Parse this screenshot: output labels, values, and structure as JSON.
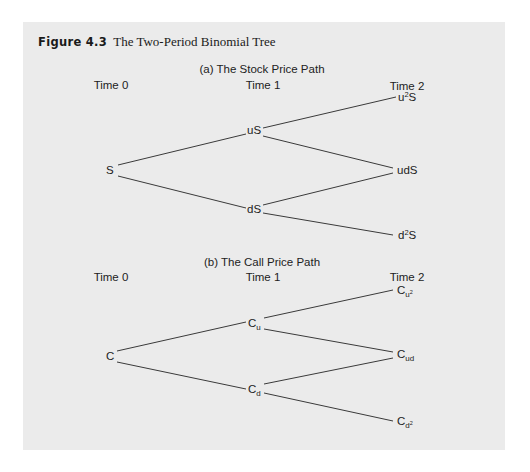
{
  "figure": {
    "number": "Figure 4.3",
    "title": "The Two-Period Binomial Tree"
  },
  "panel_a": {
    "subtitle": "(a) The Stock Price Path",
    "time_labels": [
      "Time 0",
      "Time 1",
      "Time 2"
    ],
    "nodes": {
      "root": "S",
      "up": "uS",
      "down": "dS",
      "up_up_base": "u",
      "up_up_exp": "2",
      "up_up_tail": "S",
      "up_down": "udS",
      "down_down_base": "d",
      "down_down_exp": "2",
      "down_down_tail": "S"
    }
  },
  "panel_b": {
    "subtitle": "(b) The Call Price Path",
    "time_labels": [
      "Time 0",
      "Time 1",
      "Time 2"
    ],
    "nodes": {
      "root": "C",
      "up_base": "C",
      "up_sub": "u",
      "down_base": "C",
      "down_sub": "d",
      "up_up_base": "C",
      "up_up_sub": "u",
      "up_up_exp": "2",
      "up_down_base": "C",
      "up_down_sub": "ud",
      "down_down_base": "C",
      "down_down_sub": "d",
      "down_down_exp": "2"
    }
  },
  "colors": {
    "panel_background": "#ebebeb",
    "page_background": "#ffffff",
    "line": "#3a3a3a",
    "text": "#222222"
  }
}
